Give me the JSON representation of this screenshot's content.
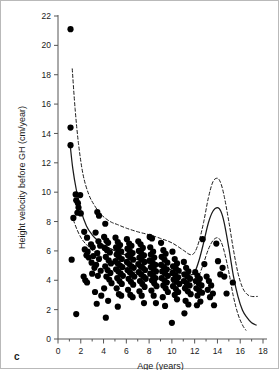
{
  "figure": {
    "panel_letter": "c",
    "background_color": "#ffffff",
    "border_color": "#b9b9b9",
    "marker_color": "#000000",
    "curve_color": "#1a1a1a"
  },
  "chart_data": {
    "type": "scatter",
    "title": "",
    "subtitle": "",
    "xlabel": "Age (years)",
    "ylabel": "Height velocity before GH (cm/year)",
    "xlim": [
      0,
      18
    ],
    "ylim": [
      0,
      22
    ],
    "xticks": [
      0,
      2,
      4,
      6,
      8,
      10,
      12,
      14,
      16,
      18
    ],
    "yticks": [
      0,
      2,
      4,
      6,
      8,
      10,
      12,
      14,
      16,
      18,
      20,
      22
    ],
    "xtick_labels": [
      "0",
      "2",
      "4",
      "6",
      "8",
      "10",
      "12",
      "14",
      "16",
      "18"
    ],
    "ytick_labels": [
      "0",
      "2",
      "4",
      "6",
      "8",
      "10",
      "12",
      "14",
      "16",
      "18",
      "20",
      "22"
    ],
    "minor_ticks": true,
    "grid": false,
    "legend": null,
    "legend_position": "none",
    "marker_size": 3.1,
    "series": [
      {
        "name": "Height velocity before GH",
        "type": "scatter",
        "marker": "filled-circle",
        "color": "#000000",
        "points": [
          [
            1.1,
            21.1
          ],
          [
            1.1,
            14.4
          ],
          [
            1.1,
            13.2
          ],
          [
            1.55,
            9.85
          ],
          [
            1.95,
            9.8
          ],
          [
            1.6,
            9.45
          ],
          [
            1.75,
            9.25
          ],
          [
            1.8,
            8.95
          ],
          [
            1.7,
            8.6
          ],
          [
            1.35,
            8.25
          ],
          [
            2.0,
            8.55
          ],
          [
            3.45,
            8.65
          ],
          [
            3.6,
            8.4
          ],
          [
            4.15,
            7.85
          ],
          [
            1.2,
            5.4
          ],
          [
            1.6,
            1.7
          ],
          [
            2.3,
            7.3
          ],
          [
            2.55,
            6.9
          ],
          [
            2.35,
            6.1
          ],
          [
            2.6,
            5.95
          ],
          [
            2.5,
            5.7
          ],
          [
            2.7,
            5.55
          ],
          [
            2.4,
            4.0
          ],
          [
            2.55,
            3.85
          ],
          [
            2.25,
            4.25
          ],
          [
            2.9,
            6.45
          ],
          [
            3.05,
            6.25
          ],
          [
            3.1,
            5.65
          ],
          [
            2.95,
            5.2
          ],
          [
            3.2,
            4.85
          ],
          [
            3.0,
            4.45
          ],
          [
            3.3,
            7.25
          ],
          [
            3.55,
            6.65
          ],
          [
            3.7,
            6.35
          ],
          [
            3.45,
            5.85
          ],
          [
            3.6,
            5.45
          ],
          [
            3.35,
            5.05
          ],
          [
            3.75,
            4.65
          ],
          [
            3.5,
            4.3
          ],
          [
            3.25,
            3.2
          ],
          [
            3.8,
            2.95
          ],
          [
            3.4,
            2.4
          ],
          [
            4.05,
            6.95
          ],
          [
            4.25,
            6.7
          ],
          [
            4.4,
            6.55
          ],
          [
            4.1,
            6.2
          ],
          [
            4.3,
            6.05
          ],
          [
            4.55,
            5.9
          ],
          [
            4.2,
            5.6
          ],
          [
            4.45,
            5.35
          ],
          [
            4.65,
            5.15
          ],
          [
            4.15,
            4.95
          ],
          [
            4.35,
            4.7
          ],
          [
            4.6,
            4.5
          ],
          [
            4.25,
            4.25
          ],
          [
            4.5,
            4.05
          ],
          [
            4.7,
            3.8
          ],
          [
            4.05,
            3.45
          ],
          [
            4.4,
            2.6
          ],
          [
            4.2,
            1.45
          ],
          [
            5.05,
            6.9
          ],
          [
            5.25,
            6.6
          ],
          [
            5.45,
            6.4
          ],
          [
            5.1,
            6.25
          ],
          [
            5.3,
            6.05
          ],
          [
            5.55,
            5.95
          ],
          [
            5.15,
            5.75
          ],
          [
            5.35,
            5.6
          ],
          [
            5.6,
            5.45
          ],
          [
            5.05,
            5.3
          ],
          [
            5.25,
            5.15
          ],
          [
            5.45,
            5.0
          ],
          [
            5.65,
            4.9
          ],
          [
            5.1,
            4.75
          ],
          [
            5.3,
            4.6
          ],
          [
            5.5,
            4.45
          ],
          [
            5.7,
            4.3
          ],
          [
            5.2,
            4.15
          ],
          [
            5.4,
            3.95
          ],
          [
            5.6,
            3.75
          ],
          [
            5.15,
            3.45
          ],
          [
            5.35,
            3.05
          ],
          [
            5.55,
            2.95
          ],
          [
            5.25,
            2.2
          ],
          [
            6.05,
            6.8
          ],
          [
            6.25,
            6.5
          ],
          [
            6.45,
            6.35
          ],
          [
            6.1,
            6.15
          ],
          [
            6.3,
            6.0
          ],
          [
            6.55,
            5.85
          ],
          [
            6.15,
            5.7
          ],
          [
            6.35,
            5.55
          ],
          [
            6.6,
            5.4
          ],
          [
            6.05,
            5.25
          ],
          [
            6.25,
            5.1
          ],
          [
            6.45,
            4.95
          ],
          [
            6.65,
            4.85
          ],
          [
            6.1,
            4.7
          ],
          [
            6.3,
            4.55
          ],
          [
            6.5,
            4.4
          ],
          [
            6.7,
            4.25
          ],
          [
            6.2,
            4.1
          ],
          [
            6.4,
            3.9
          ],
          [
            6.6,
            3.7
          ],
          [
            6.15,
            3.35
          ],
          [
            6.35,
            3.0
          ],
          [
            6.55,
            2.85
          ],
          [
            7.05,
            6.65
          ],
          [
            7.25,
            6.45
          ],
          [
            7.45,
            6.2
          ],
          [
            7.1,
            6.0
          ],
          [
            7.3,
            5.85
          ],
          [
            7.55,
            5.7
          ],
          [
            7.15,
            5.55
          ],
          [
            7.35,
            5.4
          ],
          [
            7.6,
            5.25
          ],
          [
            7.05,
            5.1
          ],
          [
            7.25,
            4.95
          ],
          [
            7.45,
            4.85
          ],
          [
            7.65,
            4.7
          ],
          [
            7.1,
            4.55
          ],
          [
            7.3,
            4.4
          ],
          [
            7.5,
            4.25
          ],
          [
            7.7,
            4.1
          ],
          [
            7.2,
            3.95
          ],
          [
            7.4,
            3.75
          ],
          [
            7.6,
            3.55
          ],
          [
            7.15,
            3.25
          ],
          [
            7.35,
            2.95
          ],
          [
            7.55,
            2.45
          ],
          [
            8.05,
            6.95
          ],
          [
            8.25,
            6.85
          ],
          [
            8.1,
            6.25
          ],
          [
            8.35,
            5.95
          ],
          [
            8.15,
            5.75
          ],
          [
            8.45,
            5.55
          ],
          [
            8.05,
            5.35
          ],
          [
            8.3,
            5.2
          ],
          [
            8.55,
            5.05
          ],
          [
            8.15,
            4.9
          ],
          [
            8.4,
            4.75
          ],
          [
            8.6,
            4.6
          ],
          [
            8.1,
            4.45
          ],
          [
            8.35,
            4.3
          ],
          [
            8.55,
            4.15
          ],
          [
            8.25,
            4.0
          ],
          [
            8.45,
            3.8
          ],
          [
            8.65,
            3.6
          ],
          [
            8.2,
            3.3
          ],
          [
            8.4,
            2.95
          ],
          [
            8.6,
            2.45
          ],
          [
            9.05,
            6.55
          ],
          [
            9.25,
            6.05
          ],
          [
            9.45,
            5.8
          ],
          [
            9.1,
            5.6
          ],
          [
            9.35,
            5.4
          ],
          [
            9.6,
            5.2
          ],
          [
            9.05,
            5.05
          ],
          [
            9.3,
            4.9
          ],
          [
            9.55,
            4.75
          ],
          [
            9.15,
            4.6
          ],
          [
            9.4,
            4.45
          ],
          [
            9.65,
            4.3
          ],
          [
            9.1,
            4.15
          ],
          [
            9.35,
            4.0
          ],
          [
            9.55,
            3.85
          ],
          [
            9.25,
            3.65
          ],
          [
            9.45,
            3.45
          ],
          [
            9.65,
            3.2
          ],
          [
            9.2,
            2.85
          ],
          [
            9.4,
            2.25
          ],
          [
            10.05,
            5.95
          ],
          [
            10.25,
            5.45
          ],
          [
            10.45,
            5.15
          ],
          [
            10.1,
            4.95
          ],
          [
            10.35,
            4.8
          ],
          [
            10.6,
            4.65
          ],
          [
            10.05,
            4.5
          ],
          [
            10.3,
            4.35
          ],
          [
            10.55,
            4.2
          ],
          [
            10.15,
            4.05
          ],
          [
            10.4,
            3.9
          ],
          [
            10.65,
            3.75
          ],
          [
            10.1,
            3.6
          ],
          [
            10.35,
            3.4
          ],
          [
            10.55,
            3.2
          ],
          [
            10.25,
            3.0
          ],
          [
            10.45,
            2.7
          ],
          [
            10.0,
            1.1
          ],
          [
            11.05,
            5.25
          ],
          [
            11.25,
            4.85
          ],
          [
            11.45,
            4.6
          ],
          [
            11.1,
            4.4
          ],
          [
            11.35,
            4.25
          ],
          [
            11.6,
            4.1
          ],
          [
            11.05,
            3.95
          ],
          [
            11.3,
            3.8
          ],
          [
            11.55,
            3.65
          ],
          [
            11.15,
            3.45
          ],
          [
            11.4,
            3.25
          ],
          [
            11.65,
            3.05
          ],
          [
            11.2,
            2.6
          ],
          [
            11.45,
            2.35
          ],
          [
            11.1,
            1.75
          ],
          [
            12.05,
            4.55
          ],
          [
            12.25,
            4.3
          ],
          [
            12.45,
            4.1
          ],
          [
            12.1,
            3.95
          ],
          [
            12.35,
            3.8
          ],
          [
            12.6,
            3.65
          ],
          [
            12.15,
            3.45
          ],
          [
            12.4,
            3.3
          ],
          [
            12.65,
            3.15
          ],
          [
            12.25,
            2.95
          ],
          [
            12.5,
            2.55
          ],
          [
            12.2,
            2.3
          ],
          [
            12.7,
            6.8
          ],
          [
            12.85,
            5.1
          ],
          [
            13.05,
            4.25
          ],
          [
            13.25,
            3.95
          ],
          [
            13.45,
            3.65
          ],
          [
            13.15,
            3.35
          ],
          [
            13.6,
            3.1
          ],
          [
            13.35,
            2.85
          ],
          [
            13.9,
            6.5
          ],
          [
            14.05,
            5.3
          ],
          [
            14.25,
            4.4
          ],
          [
            14.45,
            4.85
          ],
          [
            14.6,
            4.25
          ],
          [
            15.35,
            3.85
          ],
          [
            14.8,
            3.1
          ],
          [
            13.7,
            2.3
          ]
        ]
      },
      {
        "name": "Reference median (P50)",
        "type": "line",
        "style": "solid",
        "color": "#1a1a1a",
        "x": [
          1.05,
          1.3,
          1.6,
          2.0,
          2.5,
          3.0,
          3.5,
          4.0,
          4.5,
          5.0,
          6.0,
          7.0,
          8.0,
          9.0,
          10.0,
          11.0,
          11.6,
          12.0,
          12.4,
          12.8,
          13.2,
          13.6,
          14.0,
          14.3,
          14.6,
          15.0,
          15.4,
          15.8,
          16.2,
          16.6,
          17.0,
          17.4
        ],
        "y": [
          13.35,
          11.6,
          10.2,
          8.8,
          7.7,
          7.1,
          6.7,
          6.4,
          6.2,
          6.0,
          5.7,
          5.4,
          5.15,
          4.95,
          4.7,
          4.45,
          4.35,
          4.55,
          5.4,
          6.6,
          7.9,
          8.7,
          8.95,
          8.7,
          7.9,
          6.2,
          4.3,
          2.9,
          1.95,
          1.45,
          1.1,
          0.95
        ]
      },
      {
        "name": "Reference upper limit (P97)",
        "type": "line",
        "style": "dashed",
        "color": "#1a1a1a",
        "x": [
          1.25,
          1.5,
          1.8,
          2.2,
          2.7,
          3.2,
          3.7,
          4.2,
          4.7,
          5.2,
          6.0,
          7.0,
          8.0,
          9.0,
          10.0,
          11.0,
          11.6,
          12.0,
          12.4,
          12.8,
          13.2,
          13.6,
          14.0,
          14.3,
          14.6,
          15.0,
          15.4,
          15.8,
          16.2,
          16.6,
          17.0,
          17.5
        ],
        "y": [
          18.4,
          15.7,
          13.3,
          11.2,
          9.85,
          9.1,
          8.55,
          8.2,
          7.95,
          7.8,
          7.55,
          7.3,
          7.1,
          6.85,
          6.55,
          6.05,
          5.75,
          5.9,
          6.7,
          8.0,
          9.6,
          10.7,
          10.95,
          10.6,
          9.7,
          8.0,
          6.1,
          4.5,
          3.5,
          3.05,
          2.9,
          2.9
        ]
      },
      {
        "name": "Reference lower limit (P3)",
        "type": "line",
        "style": "dashed",
        "color": "#1a1a1a",
        "x": [
          1.35,
          1.7,
          2.1,
          2.6,
          3.1,
          3.6,
          4.1,
          4.6,
          5.2,
          6.0,
          7.0,
          8.0,
          9.0,
          10.0,
          11.0,
          11.6,
          12.0,
          12.4,
          12.8,
          13.2,
          13.6,
          14.0,
          14.3,
          14.6,
          15.0,
          15.4,
          15.8,
          16.2,
          16.5
        ],
        "y": [
          8.1,
          7.4,
          6.8,
          6.35,
          6.0,
          5.7,
          5.45,
          5.25,
          5.05,
          4.75,
          4.5,
          4.25,
          4.05,
          3.85,
          3.65,
          3.55,
          3.75,
          4.35,
          5.2,
          6.1,
          6.7,
          6.9,
          6.65,
          5.95,
          4.55,
          2.9,
          1.7,
          0.95,
          0.6
        ]
      }
    ]
  }
}
